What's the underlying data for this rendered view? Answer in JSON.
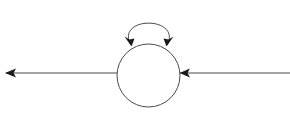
{
  "canvas": {
    "width": 290,
    "height": 115,
    "background_color": "#ffffff",
    "title": "State node with self-loop and through transition"
  },
  "style": {
    "stroke_color": "#4a4a4a",
    "arrow_color": "#1a1a1a",
    "stroke_width": 1,
    "node_fill": "#ffffff"
  },
  "diagram": {
    "type": "state-transition-diagram",
    "nodes": [
      {
        "id": "state-node",
        "shape": "circle",
        "label": "",
        "cx": 148.5,
        "cy": 75.5,
        "r": 31.5,
        "fill": "#ffffff",
        "stroke": "#4a4a4a"
      }
    ],
    "edges": [
      {
        "id": "self-loop",
        "kind": "self-loop-arc",
        "from": "state-node",
        "to": "state-node",
        "label": "",
        "path": "M 130.5 44.5 C 116 16, 181 16, 167.5 44.5",
        "arrowheads": [
          {
            "id": "self-loop-arrow-left",
            "x": 130.5,
            "y": 44.5,
            "angle_deg": 108
          },
          {
            "id": "self-loop-arrow-right",
            "x": 167.5,
            "y": 44.5,
            "angle_deg": 72
          }
        ]
      },
      {
        "id": "incoming-transition",
        "kind": "straight-line",
        "from": "right-edge",
        "to": "state-node",
        "label": "",
        "path": "M 290 73 L 179.5 73",
        "arrowheads": [
          {
            "id": "incoming-arrow",
            "x": 180,
            "y": 73,
            "angle_deg": 180
          }
        ]
      },
      {
        "id": "outgoing-transition",
        "kind": "straight-line",
        "from": "state-node",
        "to": "left-edge",
        "label": "",
        "path": "M 117 73 L 6 73",
        "arrowheads": [
          {
            "id": "outgoing-arrow",
            "x": 5,
            "y": 73,
            "angle_deg": 180
          }
        ]
      }
    ]
  }
}
